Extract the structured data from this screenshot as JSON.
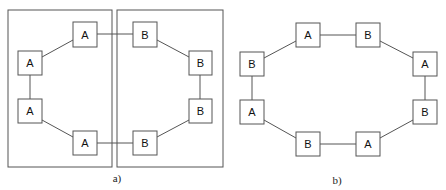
{
  "diagram_a": {
    "caption": "a)",
    "groups": [
      {
        "id": "group-a",
        "x": 8,
        "y": 10,
        "w": 104,
        "h": 157
      },
      {
        "id": "group-b",
        "x": 117,
        "y": 10,
        "w": 106,
        "h": 157
      }
    ],
    "nodes": [
      {
        "label": "A",
        "x": 73,
        "y": 22
      },
      {
        "label": "A",
        "x": 18,
        "y": 51
      },
      {
        "label": "A",
        "x": 18,
        "y": 99
      },
      {
        "label": "A",
        "x": 73,
        "y": 131
      },
      {
        "label": "B",
        "x": 133,
        "y": 22
      },
      {
        "label": "B",
        "x": 189,
        "y": 51
      },
      {
        "label": "B",
        "x": 189,
        "y": 99
      },
      {
        "label": "B",
        "x": 133,
        "y": 131
      }
    ]
  },
  "diagram_b": {
    "caption": "b)",
    "nodes": [
      {
        "label": "A",
        "x": 296,
        "y": 23
      },
      {
        "label": "B",
        "x": 356,
        "y": 23
      },
      {
        "label": "A",
        "x": 413,
        "y": 52
      },
      {
        "label": "B",
        "x": 413,
        "y": 100
      },
      {
        "label": "A",
        "x": 356,
        "y": 132
      },
      {
        "label": "B",
        "x": 296,
        "y": 132
      },
      {
        "label": "A",
        "x": 240,
        "y": 100
      },
      {
        "label": "B",
        "x": 240,
        "y": 52
      }
    ]
  },
  "colors": {
    "stroke": "#555555",
    "text": "#111111",
    "background": "#ffffff"
  }
}
